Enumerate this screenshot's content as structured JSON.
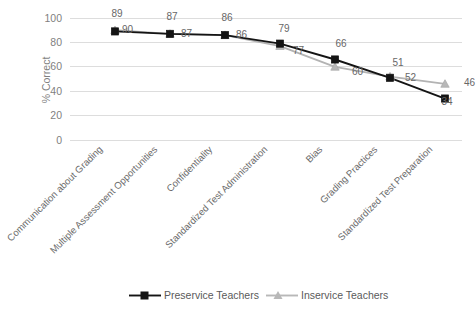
{
  "chart_data": {
    "type": "line",
    "title": "",
    "xlabel": "",
    "ylabel": "% Correct",
    "ylim": [
      0,
      100
    ],
    "yticks": [
      0,
      20,
      40,
      60,
      80,
      100
    ],
    "grid": "horizontal",
    "legend_position": "bottom-center",
    "categories": [
      "Communication about Grading",
      "Multiple Assessment Opportunities",
      "Confidentiality",
      "Standardized Test Administration",
      "Bias",
      "Grading Practices",
      "Standardized Test Preparation"
    ],
    "series": [
      {
        "name": "Preservice Teachers",
        "color": "#141414",
        "marker": "square",
        "values": [
          89,
          87,
          86,
          79,
          66,
          51,
          34
        ]
      },
      {
        "name": "Inservice Teachers",
        "color": "#b8b8b8",
        "marker": "triangle",
        "values": [
          90,
          87,
          86,
          77,
          60,
          52,
          46
        ]
      }
    ]
  },
  "axis": {
    "y_title": "% Correct",
    "y_tick_labels": [
      "100",
      "80",
      "60",
      "40",
      "20",
      "0"
    ]
  },
  "data_labels": {
    "preservice": [
      "89",
      "87",
      "86",
      "79",
      "66",
      "51",
      "34"
    ],
    "inservice": [
      "90",
      "87",
      "86",
      "77",
      "60",
      "52",
      "46"
    ]
  },
  "legend": {
    "items": [
      {
        "label": "Preservice Teachers",
        "marker": "square-marker",
        "color": "#141414"
      },
      {
        "label": "Inservice Teachers",
        "marker": "triangle-marker",
        "color": "#b8b8b8"
      }
    ]
  },
  "colors": {
    "background": "#ffffff",
    "gridline": "#d9d9d9",
    "preservice": "#141414",
    "inservice": "#b8b8b8",
    "text": "#7f7f7f"
  }
}
